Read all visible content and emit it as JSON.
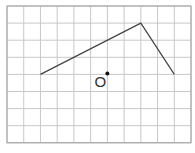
{
  "grid": {
    "x0": 7,
    "y0": 6,
    "cols": 11,
    "rows": 8,
    "cell_w": 16.73,
    "cell_h": 17.1,
    "line_color": "#c8c8c8",
    "border_color": "#a0a0a0"
  },
  "polyline": {
    "points_grid": [
      [
        2,
        4
      ],
      [
        8,
        1
      ],
      [
        10,
        4
      ]
    ],
    "color": "#444444"
  },
  "point": {
    "label": "O",
    "grid": [
      6,
      4
    ],
    "color": "#111111"
  }
}
